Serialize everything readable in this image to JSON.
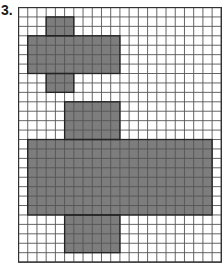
{
  "problem": {
    "number_label": "3."
  },
  "grid": {
    "columns": 22,
    "rows": 27,
    "cell_width": 9.22,
    "cell_height": 9.43,
    "line_color": "#555555",
    "border_color": "#333333",
    "shade_color": "#7d7d7d",
    "outline_color": "#222222"
  },
  "shapes": [
    {
      "name": "cross-shape",
      "rects": [
        {
          "col": 3,
          "row": 1,
          "cols": 3,
          "rows": 2
        },
        {
          "col": 1,
          "row": 3,
          "cols": 10,
          "rows": 4
        },
        {
          "col": 3,
          "row": 7,
          "cols": 3,
          "rows": 2
        }
      ]
    },
    {
      "name": "large-cross-shape",
      "rects": [
        {
          "col": 5,
          "row": 10,
          "cols": 6,
          "rows": 4
        },
        {
          "col": 1,
          "row": 14,
          "cols": 20,
          "rows": 8
        },
        {
          "col": 5,
          "row": 22,
          "cols": 6,
          "rows": 4
        }
      ]
    }
  ]
}
